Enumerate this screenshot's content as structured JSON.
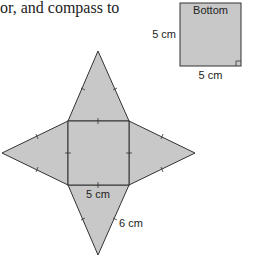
{
  "caption": "or, and compass to",
  "colors": {
    "fill": "#c8c8c8",
    "stroke": "#333333"
  },
  "bottom_view": {
    "title": "Bottom",
    "side_label": "5 cm",
    "base_label": "5 cm"
  },
  "net": {
    "base_label": "5 cm",
    "slant_label": "6 cm"
  }
}
